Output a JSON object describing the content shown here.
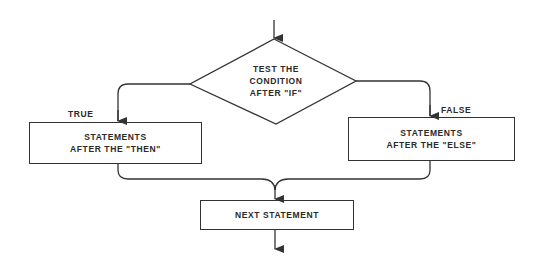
{
  "diagram": {
    "type": "flowchart",
    "decision": {
      "lines": [
        "TEST THE",
        "CONDITION",
        "AFTER \"IF\""
      ]
    },
    "branches": {
      "true": {
        "label": "TRUE",
        "box_lines": [
          "STATEMENTS",
          "AFTER THE \"THEN\""
        ]
      },
      "false": {
        "label": "FALSE",
        "box_lines": [
          "STATEMENTS",
          "AFTER THE \"ELSE\""
        ]
      }
    },
    "next": {
      "label": "NEXT STATEMENT"
    },
    "colors": {
      "stroke": "#333333",
      "text": "#2a2a2a",
      "background": "#ffffff"
    }
  }
}
